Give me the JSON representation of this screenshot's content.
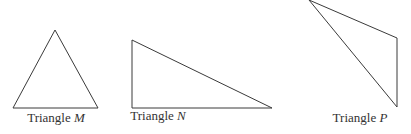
{
  "figure": {
    "triangles": [
      {
        "id": "M",
        "name_prefix": "Triangle",
        "letter": "M",
        "points": "55,30 13,108 98,108",
        "label_x": 56,
        "label_y": 110
      },
      {
        "id": "N",
        "name_prefix": "Triangle",
        "letter": "N",
        "points": "132,40 132,108 272,108",
        "label_x": 158,
        "label_y": 108
      },
      {
        "id": "P",
        "name_prefix": "Triangle",
        "letter": "P",
        "points": "309,0 397,38 397,107",
        "label_x": 360,
        "label_y": 110
      }
    ],
    "stroke_color": "#3a3a3a",
    "background": "#ffffff"
  }
}
